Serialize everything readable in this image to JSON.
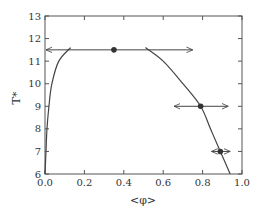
{
  "chart_data": {
    "type": "scatter",
    "title": "",
    "xlabel": "<φ>",
    "ylabel": "T*",
    "xlim": [
      0.0,
      1.0
    ],
    "ylim": [
      6,
      13
    ],
    "xticks": [
      "0.0",
      "0.2",
      "0.4",
      "0.6",
      "0.8",
      "1.0"
    ],
    "yticks": [
      "6",
      "7",
      "8",
      "9",
      "10",
      "11",
      "12",
      "13"
    ],
    "grid": false,
    "series": [
      {
        "name": "coexistence-curve-left-branch",
        "kind": "line",
        "points": [
          [
            0.0,
            6.0
          ],
          [
            0.005,
            7.0
          ],
          [
            0.01,
            8.0
          ],
          [
            0.02,
            9.0
          ],
          [
            0.035,
            10.0
          ],
          [
            0.07,
            11.0
          ],
          [
            0.13,
            11.6
          ]
        ]
      },
      {
        "name": "coexistence-curve-right-branch",
        "kind": "line",
        "points": [
          [
            0.51,
            11.6
          ],
          [
            0.6,
            11.0
          ],
          [
            0.7,
            10.0
          ],
          [
            0.79,
            9.0
          ],
          [
            0.84,
            8.0
          ],
          [
            0.89,
            7.0
          ],
          [
            0.94,
            6.0
          ]
        ]
      },
      {
        "name": "simulation-points",
        "kind": "points-with-range-arrows",
        "points": [
          {
            "x": 0.35,
            "y": 11.5,
            "xmin": 0.0,
            "xmax": 0.75
          },
          {
            "x": 0.79,
            "y": 9.0,
            "xmin": 0.65,
            "xmax": 0.93
          },
          {
            "x": 0.89,
            "y": 7.0,
            "xmin": 0.84,
            "xmax": 0.94
          }
        ]
      }
    ]
  }
}
